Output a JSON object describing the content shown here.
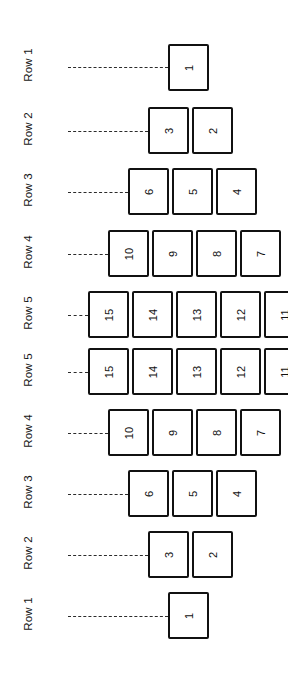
{
  "figure": {
    "type": "diagram",
    "orientation": "rotated-90-ccw",
    "background": "#ffffff",
    "box_stroke": "#111111",
    "leader_stroke": "#2b2b2b",
    "text_color": "#111111"
  },
  "row_labels": [
    {
      "text": "Row 1",
      "center_y": 67
    },
    {
      "text": "Row 2",
      "center_y": 131
    },
    {
      "text": "Row 3",
      "center_y": 192
    },
    {
      "text": "Row 4",
      "center_y": 254
    },
    {
      "text": "Row 5",
      "center_y": 315
    },
    {
      "text": "Row 5",
      "center_y": 372
    },
    {
      "text": "Row 4",
      "center_y": 433
    },
    {
      "text": "Row 3",
      "center_y": 494
    },
    {
      "text": "Row 2",
      "center_y": 555
    },
    {
      "text": "Row 1",
      "center_y": 616
    }
  ],
  "leaders": [
    {
      "name": "leader-row1-top",
      "x": 68,
      "y": 67,
      "length": 100
    },
    {
      "name": "leader-row2-top",
      "x": 68,
      "y": 131,
      "length": 80
    },
    {
      "name": "leader-row3-top",
      "x": 68,
      "y": 192,
      "length": 60
    },
    {
      "name": "leader-row4-top",
      "x": 68,
      "y": 254,
      "length": 40
    },
    {
      "name": "leader-row5-top",
      "x": 68,
      "y": 315,
      "length": 20
    },
    {
      "name": "leader-row5-bottom",
      "x": 68,
      "y": 372,
      "length": 20
    },
    {
      "name": "leader-row4-bottom",
      "x": 68,
      "y": 433,
      "length": 40
    },
    {
      "name": "leader-row3-bottom",
      "x": 68,
      "y": 494,
      "length": 60
    },
    {
      "name": "leader-row2-bottom",
      "x": 68,
      "y": 555,
      "length": 80
    },
    {
      "name": "leader-row1-bottom",
      "x": 68,
      "y": 616,
      "length": 100
    }
  ],
  "boxes": [
    {
      "label": "1",
      "x": 168,
      "y": 44,
      "w": 41,
      "h": 47,
      "row": "Row 1",
      "half": "top"
    },
    {
      "label": "3",
      "x": 148,
      "y": 107,
      "w": 41,
      "h": 47,
      "row": "Row 2",
      "half": "top"
    },
    {
      "label": "2",
      "x": 192,
      "y": 107,
      "w": 41,
      "h": 47,
      "row": "Row 2",
      "half": "top"
    },
    {
      "label": "6",
      "x": 128,
      "y": 168,
      "w": 41,
      "h": 47,
      "row": "Row 3",
      "half": "top"
    },
    {
      "label": "5",
      "x": 172,
      "y": 168,
      "w": 41,
      "h": 47,
      "row": "Row 3",
      "half": "top"
    },
    {
      "label": "4",
      "x": 216,
      "y": 168,
      "w": 41,
      "h": 47,
      "row": "Row 3",
      "half": "top"
    },
    {
      "label": "10",
      "x": 108,
      "y": 230,
      "w": 41,
      "h": 47,
      "row": "Row 4",
      "half": "top"
    },
    {
      "label": "9",
      "x": 152,
      "y": 230,
      "w": 41,
      "h": 47,
      "row": "Row 4",
      "half": "top"
    },
    {
      "label": "8",
      "x": 196,
      "y": 230,
      "w": 41,
      "h": 47,
      "row": "Row 4",
      "half": "top"
    },
    {
      "label": "7",
      "x": 240,
      "y": 230,
      "w": 41,
      "h": 47,
      "row": "Row 4",
      "half": "top"
    },
    {
      "label": "15",
      "x": 88,
      "y": 291,
      "w": 41,
      "h": 47,
      "row": "Row 5",
      "half": "top"
    },
    {
      "label": "14",
      "x": 132,
      "y": 291,
      "w": 41,
      "h": 47,
      "row": "Row 5",
      "half": "top"
    },
    {
      "label": "13",
      "x": 176,
      "y": 291,
      "w": 41,
      "h": 47,
      "row": "Row 5",
      "half": "top"
    },
    {
      "label": "12",
      "x": 220,
      "y": 291,
      "w": 41,
      "h": 47,
      "row": "Row 5",
      "half": "top"
    },
    {
      "label": "11",
      "x": 264,
      "y": 291,
      "w": 41,
      "h": 47,
      "row": "Row 5",
      "half": "top"
    },
    {
      "label": "15",
      "x": 88,
      "y": 348,
      "w": 41,
      "h": 47,
      "row": "Row 5",
      "half": "bottom"
    },
    {
      "label": "14",
      "x": 132,
      "y": 348,
      "w": 41,
      "h": 47,
      "row": "Row 5",
      "half": "bottom"
    },
    {
      "label": "13",
      "x": 176,
      "y": 348,
      "w": 41,
      "h": 47,
      "row": "Row 5",
      "half": "bottom"
    },
    {
      "label": "12",
      "x": 220,
      "y": 348,
      "w": 41,
      "h": 47,
      "row": "Row 5",
      "half": "bottom"
    },
    {
      "label": "11",
      "x": 264,
      "y": 348,
      "w": 41,
      "h": 47,
      "row": "Row 5",
      "half": "bottom"
    },
    {
      "label": "10",
      "x": 108,
      "y": 409,
      "w": 41,
      "h": 47,
      "row": "Row 4",
      "half": "bottom"
    },
    {
      "label": "9",
      "x": 152,
      "y": 409,
      "w": 41,
      "h": 47,
      "row": "Row 4",
      "half": "bottom"
    },
    {
      "label": "8",
      "x": 196,
      "y": 409,
      "w": 41,
      "h": 47,
      "row": "Row 4",
      "half": "bottom"
    },
    {
      "label": "7",
      "x": 240,
      "y": 409,
      "w": 41,
      "h": 47,
      "row": "Row 4",
      "half": "bottom"
    },
    {
      "label": "6",
      "x": 128,
      "y": 470,
      "w": 41,
      "h": 47,
      "row": "Row 3",
      "half": "bottom"
    },
    {
      "label": "5",
      "x": 172,
      "y": 470,
      "w": 41,
      "h": 47,
      "row": "Row 3",
      "half": "bottom"
    },
    {
      "label": "4",
      "x": 216,
      "y": 470,
      "w": 41,
      "h": 47,
      "row": "Row 3",
      "half": "bottom"
    },
    {
      "label": "3",
      "x": 148,
      "y": 531,
      "w": 41,
      "h": 47,
      "row": "Row 2",
      "half": "bottom"
    },
    {
      "label": "2",
      "x": 192,
      "y": 531,
      "w": 41,
      "h": 47,
      "row": "Row 2",
      "half": "bottom"
    },
    {
      "label": "1",
      "x": 168,
      "y": 592,
      "w": 41,
      "h": 47,
      "row": "Row 1",
      "half": "bottom"
    }
  ]
}
